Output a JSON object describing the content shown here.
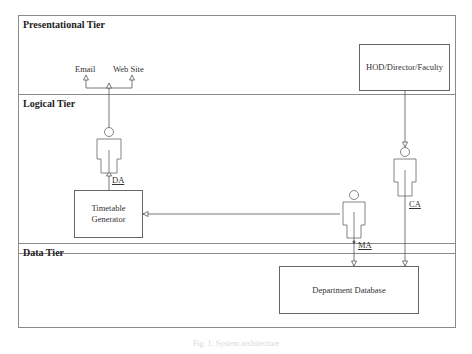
{
  "tiers": [
    {
      "id": "presentational",
      "title": "Presentational Tier"
    },
    {
      "id": "logical",
      "title": "Logical Tier"
    },
    {
      "id": "data",
      "title": "Data Tier"
    }
  ],
  "nodes": {
    "email": "Email",
    "website": "Web Site",
    "hod": "HOD/Director/Faculty",
    "timetable_line1": "Timetable",
    "timetable_line2": "Generator",
    "database": "Department Database"
  },
  "actors": {
    "da": "DA",
    "ca": "CA",
    "ma": "MA"
  },
  "caption": "Fig. 1: System architecture"
}
